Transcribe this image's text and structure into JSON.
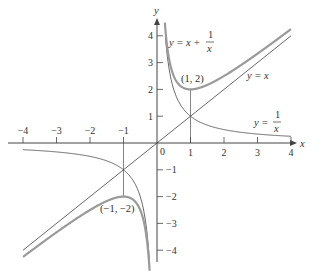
{
  "figure": {
    "axis_x_label": "x",
    "axis_y_label": "y",
    "x_ticks": [
      "-4",
      "-3",
      "-2",
      "-1",
      "0",
      "1",
      "2",
      "3",
      "4"
    ],
    "y_ticks": [
      "4",
      "3",
      "2",
      "1",
      "-1",
      "-2",
      "-3",
      "-4"
    ],
    "labels": {
      "curve_f": "y = x + 1/x",
      "curve_f_lhs": "y = x +",
      "curve_f_num": "1",
      "curve_f_den": "x",
      "line_yx": "y = x",
      "curve_recip_lhs": "y =",
      "curve_recip_num": "1",
      "curve_recip_den": "x",
      "point_min": "(1, 2)",
      "point_max": "(−1, −2)"
    },
    "colors": {
      "axes": "#444444",
      "main_curve": "#9a9a9a",
      "thin_curves": "#555555"
    }
  },
  "chart_data": {
    "type": "line",
    "title": "",
    "xlabel": "x",
    "ylabel": "y",
    "xlim": [
      -4,
      4
    ],
    "ylim": [
      -4.5,
      4.3
    ],
    "grid": false,
    "series": [
      {
        "name": "y = x + 1/x",
        "style": "thick gray",
        "domain": [
          [
            -4,
            -0.23
          ],
          [
            0.23,
            4
          ]
        ]
      },
      {
        "name": "y = x",
        "style": "thin dark",
        "domain": [
          -4,
          4
        ]
      },
      {
        "name": "y = 1/x",
        "style": "thin dark",
        "domain": [
          [
            -4,
            -0.23
          ],
          [
            0.25,
            4
          ]
        ]
      }
    ],
    "annotations": [
      {
        "text": "(1, 2)",
        "x": 1,
        "y": 2,
        "note": "local minimum"
      },
      {
        "text": "(−1, −2)",
        "x": -1,
        "y": -2,
        "note": "local maximum"
      }
    ],
    "guide_lines": [
      {
        "x": 1,
        "from_y": 0,
        "to_y": 2
      },
      {
        "x": -1,
        "from_y": 0,
        "to_y": -2
      }
    ]
  }
}
